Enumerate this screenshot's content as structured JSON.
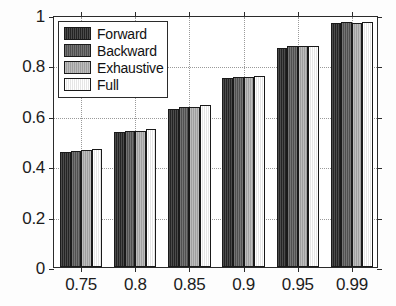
{
  "chart_data": {
    "type": "bar",
    "title": "",
    "subtitle": "",
    "xlabel": "",
    "ylabel": "",
    "categories": [
      "0.75",
      "0.8",
      "0.85",
      "0.9",
      "0.95",
      "0.99"
    ],
    "series": [
      {
        "name": "Forward",
        "color": "#282828",
        "values": [
          0.455,
          0.534,
          0.629,
          0.749,
          0.868,
          0.969
        ]
      },
      {
        "name": "Backward",
        "color": "#595959",
        "values": [
          0.461,
          0.538,
          0.634,
          0.754,
          0.878,
          0.971
        ]
      },
      {
        "name": "Exhaustive",
        "color": "#b0b0b0",
        "values": [
          0.463,
          0.54,
          0.636,
          0.755,
          0.879,
          0.97
        ]
      },
      {
        "name": "Full",
        "color": "#ffffff",
        "values": [
          0.467,
          0.546,
          0.642,
          0.758,
          0.879,
          0.971
        ]
      }
    ],
    "ylim": [
      0,
      1
    ],
    "yticks": [
      0,
      0.2,
      0.4,
      0.6,
      0.8,
      1
    ],
    "ytick_labels": [
      "0",
      "0.2",
      "0.4",
      "0.6",
      "0.8",
      "1"
    ],
    "xtick_labels": [
      "0.75",
      "0.8",
      "0.85",
      "0.9",
      "0.95",
      "0.99"
    ],
    "grid": true,
    "grid_style": "dotted",
    "grid_color": "#9a9a9a",
    "legend_position": "upper-left",
    "axis_color": "#2b2b2b",
    "background": "#ffffff"
  },
  "legend": {
    "items": [
      {
        "label": "Forward"
      },
      {
        "label": "Backward"
      },
      {
        "label": "Exhaustive"
      },
      {
        "label": "Full"
      }
    ]
  }
}
